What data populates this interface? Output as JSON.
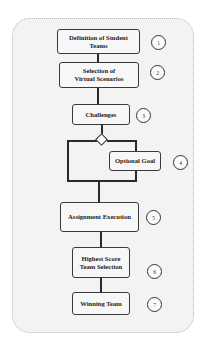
{
  "diagram": {
    "steps": [
      {
        "label": "Definition of Student Teams",
        "number": "1"
      },
      {
        "label": "Selection of Virtual Scenarios",
        "number": "2"
      },
      {
        "label": "Challenges",
        "number": "3"
      },
      {
        "label": "Optional Goal",
        "number": "4"
      },
      {
        "label": "Assignment Execution",
        "number": "5"
      },
      {
        "label": "Highest Score Team Selection",
        "number": "6"
      },
      {
        "label": "Winning Team",
        "number": "7"
      }
    ],
    "decision_node": "diamond",
    "colors": {
      "frame_bg": "#f3f3f3",
      "frame_border": "#b8b8b8",
      "box_border": "#3a3a3a",
      "connector": "#2a2a2a"
    }
  }
}
